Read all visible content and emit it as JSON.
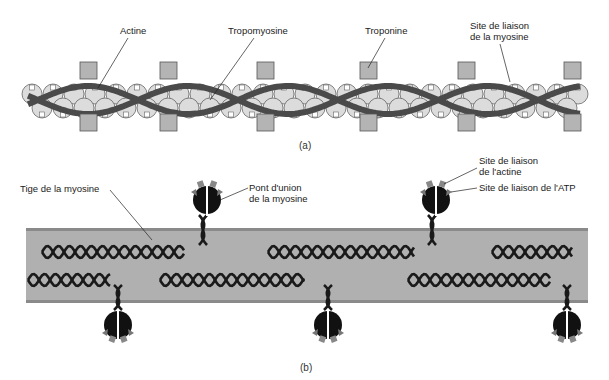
{
  "panel_a": {
    "caption": "(a)",
    "labels": {
      "actine": "Actine",
      "tropomyosine": "Tropomyosine",
      "troponine": "Troponine",
      "myosin_site_line1": "Site de liaison",
      "myosin_site_line2": "de la myosine"
    }
  },
  "panel_b": {
    "caption": "(b)",
    "labels": {
      "tige": "Tige de la myosine",
      "pont_line1": "Pont d'union",
      "pont_line2": "de la myosine",
      "actin_site_line1": "Site de liaison",
      "actin_site_line2": "de l'actine",
      "atp_site": "Site de liaison de l'ATP"
    }
  },
  "colors": {
    "strand": "#4a4a4a",
    "globule": "#dcdcdc",
    "troponin": "#b4b4b4",
    "thick_filament": "#b0b0b0",
    "thick_edge": "#8a8a8a",
    "myosin_head": "#111111",
    "helix": "#1a1a1a"
  }
}
